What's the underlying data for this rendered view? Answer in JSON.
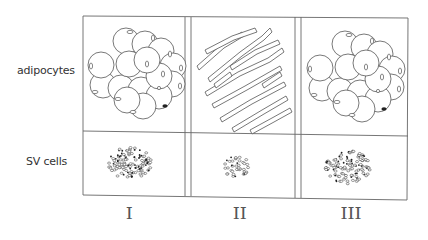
{
  "row_labels": {
    "adipocytes": "adipocytes",
    "sv_cells": "SV cells"
  },
  "columns": [
    {
      "numeral": "I",
      "adipocytes": "cluster",
      "sv_density": "dense"
    },
    {
      "numeral": "II",
      "adipocytes": "elongated",
      "sv_density": "sparse"
    },
    {
      "numeral": "III",
      "adipocytes": "cluster",
      "sv_density": "dense"
    }
  ],
  "colors": {
    "line": "#555555",
    "background": "#ffffff"
  }
}
